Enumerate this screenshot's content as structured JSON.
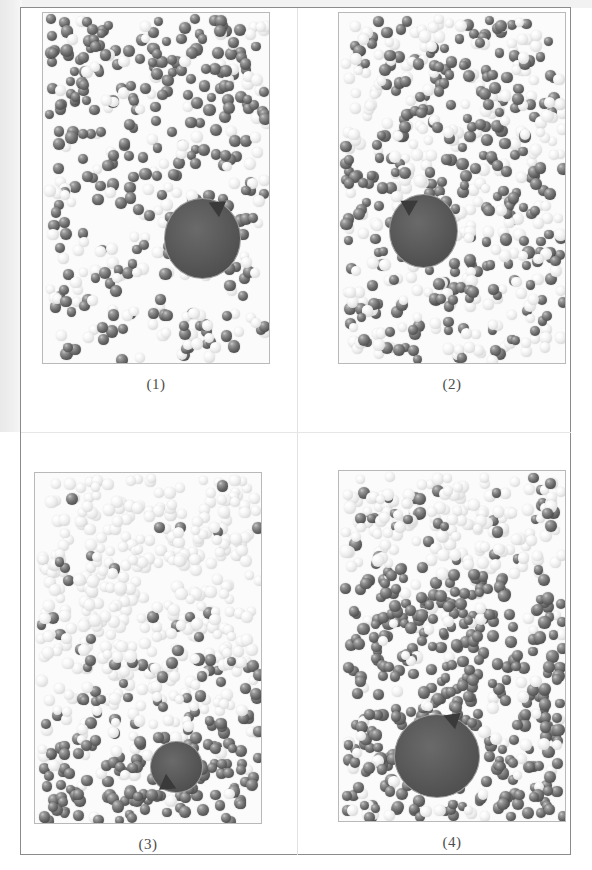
{
  "figure": {
    "kind": "molecular-dynamics-snapshot-grid",
    "rows": 2,
    "columns": 2,
    "background_color": "#ffffff",
    "frame_color": "#8b8b8b",
    "panel_border_color": "#b9b9b9"
  },
  "legend_colors": {
    "dark_particle": "#6f6f6f",
    "light_particle": "#ededed",
    "obstacle": "#4f4f4f",
    "arrow": "#3a3a3a"
  },
  "panels": [
    {
      "caption": "(1)",
      "particle_count": 520,
      "dark_fraction": 0.62,
      "seed": 11,
      "density_profile": "dense-top-sparse-bottom",
      "obstacle": {
        "cx_pct": 70.0,
        "cy_pct": 64.0,
        "rx_pct": 17.0,
        "ry_pct": 11.5,
        "arrow_direction": "up-right",
        "arrow_angle_deg": 35
      }
    },
    {
      "caption": "(2)",
      "particle_count": 620,
      "dark_fraction": 0.45,
      "seed": 27,
      "density_profile": "uniform-striped",
      "obstacle": {
        "cx_pct": 37.0,
        "cy_pct": 62.0,
        "rx_pct": 15.0,
        "ry_pct": 10.5,
        "arrow_direction": "up-left",
        "arrow_angle_deg": 150
      }
    },
    {
      "caption": "(3)",
      "particle_count": 640,
      "dark_fraction": 0.34,
      "seed": 43,
      "density_profile": "light-top-dark-bottom-right",
      "obstacle": {
        "cx_pct": 62.0,
        "cy_pct": 83.5,
        "rx_pct": 11.5,
        "ry_pct": 7.5,
        "arrow_direction": "down-left",
        "arrow_angle_deg": 215
      }
    },
    {
      "caption": "(4)",
      "particle_count": 660,
      "dark_fraction": 0.66,
      "seed": 59,
      "density_profile": "light-top-band-dark-body",
      "obstacle": {
        "cx_pct": 43.0,
        "cy_pct": 81.0,
        "rx_pct": 19.0,
        "ry_pct": 12.0,
        "arrow_direction": "up-right",
        "arrow_angle_deg": 40
      }
    }
  ],
  "geometry": {
    "panel_boxes": [
      {
        "left": 42,
        "top": 12,
        "width": 228,
        "height": 352,
        "caption_top": 370
      },
      {
        "left": 338,
        "top": 12,
        "width": 228,
        "height": 352,
        "caption_top": 370
      },
      {
        "left": 34,
        "top": 472,
        "width": 228,
        "height": 352,
        "caption_top": 830
      },
      {
        "left": 338,
        "top": 470,
        "width": 228,
        "height": 352,
        "caption_top": 830
      }
    ]
  }
}
